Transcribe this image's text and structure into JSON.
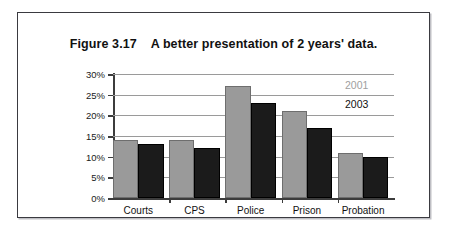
{
  "figure": {
    "title": "Figure 3.17    A better presentation of 2 years' data."
  },
  "legend": {
    "series_2001_label": "2001",
    "series_2003_label": "2003",
    "series_2001_color": "#9a9a9a",
    "series_2003_color": "#1b1b1b",
    "position": "top-right inside plot"
  },
  "axis": {
    "y_ticks": [
      "0%",
      "5%",
      "10%",
      "15%",
      "20%",
      "25%",
      "30%"
    ],
    "y_ticks_desc": [
      "30%",
      "25%",
      "20%",
      "15%",
      "10%",
      "5%",
      "0%"
    ]
  },
  "chart_data": {
    "type": "bar",
    "title": "Figure 3.17    A better presentation of 2 years' data.",
    "categories": [
      "Courts",
      "CPS",
      "Police",
      "Prison",
      "Probation"
    ],
    "series": [
      {
        "name": "2001",
        "color": "#9a9a9a",
        "values": [
          14,
          14,
          27,
          21,
          11
        ]
      },
      {
        "name": "2003",
        "color": "#1b1b1b",
        "values": [
          13,
          12,
          23,
          17,
          10
        ]
      }
    ],
    "xlabel": "",
    "ylabel": "",
    "ylim": [
      0,
      30
    ],
    "ytick_step": 5,
    "ytick_labels": [
      "0%",
      "5%",
      "10%",
      "15%",
      "20%",
      "25%",
      "30%"
    ],
    "value_unit": "%",
    "grid": true,
    "grid_axis": "y",
    "legend_position": "upper right"
  }
}
